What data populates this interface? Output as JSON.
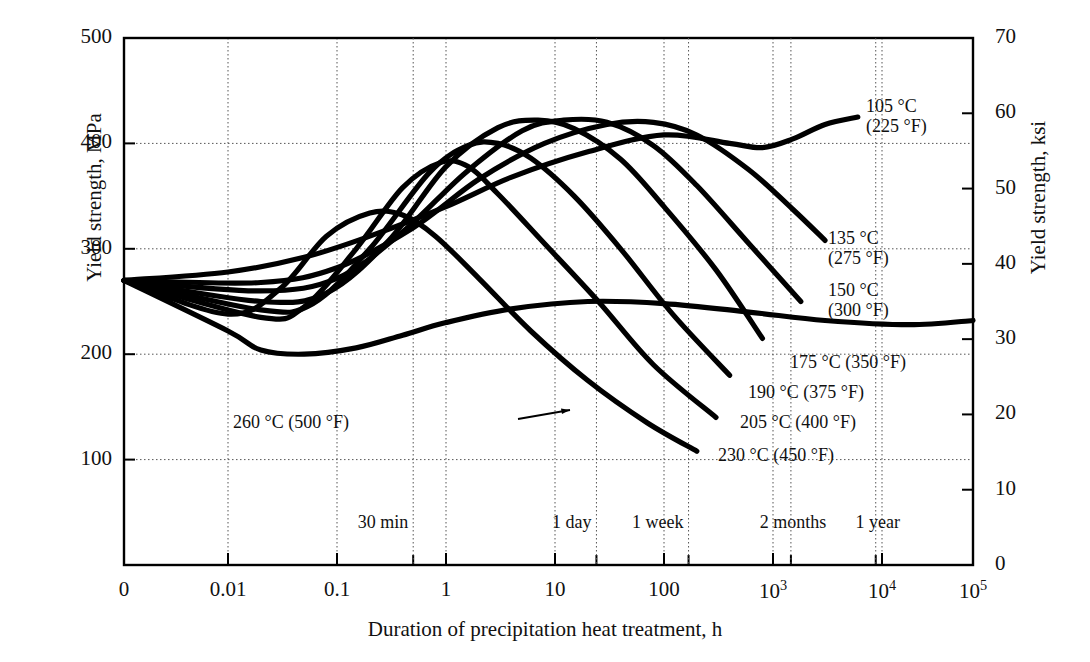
{
  "axes": {
    "y_left_label": "Yield strength, MPa",
    "y_right_label": "Yield strength, ksi",
    "x_label": "Duration of precipitation heat treatment, h",
    "y_left_ticks": [
      "500",
      "400",
      "300",
      "200",
      "100"
    ],
    "y_right_ticks": [
      "70",
      "60",
      "50",
      "40",
      "30",
      "20",
      "10",
      "0"
    ],
    "x_ticks": [
      "0",
      "0.01",
      "0.1",
      "1",
      "10",
      "100",
      "10³",
      "10⁴",
      "10⁵"
    ]
  },
  "time_markers": [
    {
      "label": "30 min",
      "x": 0.5
    },
    {
      "label": "1 day",
      "x": 24
    },
    {
      "label": "1 week",
      "x": 168
    },
    {
      "label": "2 months",
      "x": 1460
    },
    {
      "label": "1 year",
      "x": 8760
    }
  ],
  "annotations": [
    {
      "name": "label-105c",
      "line1": "105 °C",
      "line2": "(225 °F)"
    },
    {
      "name": "label-135c",
      "line1": "135 °C",
      "line2": "(275 °F)"
    },
    {
      "name": "label-150c",
      "line1": "150 °C",
      "line2": "(300 °F)"
    },
    {
      "name": "label-175c",
      "line1": "175 °C (350 °F)",
      "line2": ""
    },
    {
      "name": "label-190c",
      "line1": "190 °C (375 °F)",
      "line2": ""
    },
    {
      "name": "label-205c",
      "line1": "205 °C (400 °F)",
      "line2": ""
    },
    {
      "name": "label-230c",
      "line1": "230 °C (450 °F)",
      "line2": ""
    },
    {
      "name": "label-260c",
      "line1": "260 °C (500 °F)",
      "line2": ""
    }
  ],
  "chart_data": {
    "type": "line",
    "title": "",
    "xlabel": "Duration of precipitation heat treatment, h",
    "ylabel": "Yield strength, MPa",
    "ylabel_secondary": "Yield strength, ksi",
    "xscale": "log-with-zero-origin",
    "xlim": [
      0,
      100000
    ],
    "ylim": [
      0,
      500
    ],
    "ylim_secondary": [
      0,
      70
    ],
    "grid": true,
    "legend": "inline-annotations-right",
    "x_tick_values": [
      0,
      0.01,
      0.1,
      1,
      10,
      100,
      1000,
      10000,
      100000
    ],
    "y_tick_values": [
      100,
      200,
      300,
      400,
      500
    ],
    "y_tick_values_secondary": [
      0,
      10,
      20,
      30,
      40,
      50,
      60,
      70
    ],
    "initial_strength_MPa": 270,
    "series": [
      {
        "name": "105 °C (225 °F)",
        "points": [
          [
            0,
            270
          ],
          [
            0.01,
            278
          ],
          [
            0.05,
            292
          ],
          [
            0.2,
            312
          ],
          [
            1,
            340
          ],
          [
            4,
            368
          ],
          [
            20,
            392
          ],
          [
            100,
            408
          ],
          [
            400,
            400
          ],
          [
            800,
            396
          ],
          [
            1500,
            404
          ],
          [
            3000,
            418
          ],
          [
            6000,
            425
          ]
        ]
      },
      {
        "name": "135 °C (275 °F)",
        "points": [
          [
            0,
            270
          ],
          [
            0.02,
            268
          ],
          [
            0.1,
            282
          ],
          [
            0.5,
            320
          ],
          [
            2,
            366
          ],
          [
            8,
            400
          ],
          [
            30,
            418
          ],
          [
            80,
            420
          ],
          [
            200,
            408
          ],
          [
            600,
            375
          ],
          [
            1500,
            338
          ],
          [
            3000,
            308
          ]
        ]
      },
      {
        "name": "150 °C (300 °F)",
        "points": [
          [
            0,
            270
          ],
          [
            0.02,
            260
          ],
          [
            0.1,
            272
          ],
          [
            0.4,
            316
          ],
          [
            1.5,
            372
          ],
          [
            5,
            412
          ],
          [
            12,
            422
          ],
          [
            30,
            420
          ],
          [
            80,
            398
          ],
          [
            200,
            360
          ],
          [
            600,
            305
          ],
          [
            1800,
            250
          ]
        ]
      },
      {
        "name": "175 °C (350 °F)",
        "points": [
          [
            0,
            270
          ],
          [
            0.02,
            250
          ],
          [
            0.08,
            258
          ],
          [
            0.3,
            308
          ],
          [
            1,
            378
          ],
          [
            3,
            415
          ],
          [
            7,
            422
          ],
          [
            15,
            414
          ],
          [
            40,
            385
          ],
          [
            100,
            340
          ],
          [
            300,
            280
          ],
          [
            800,
            215
          ]
        ]
      },
      {
        "name": "190 °C (375 °F)",
        "points": [
          [
            0,
            270
          ],
          [
            0.02,
            242
          ],
          [
            0.06,
            248
          ],
          [
            0.2,
            300
          ],
          [
            0.7,
            372
          ],
          [
            1.6,
            398
          ],
          [
            3,
            400
          ],
          [
            6,
            386
          ],
          [
            15,
            350
          ],
          [
            40,
            300
          ],
          [
            120,
            238
          ],
          [
            400,
            180
          ]
        ]
      },
      {
        "name": "205 °C (400 °F)",
        "points": [
          [
            0,
            270
          ],
          [
            0.02,
            235
          ],
          [
            0.05,
            245
          ],
          [
            0.15,
            300
          ],
          [
            0.4,
            358
          ],
          [
            0.9,
            382
          ],
          [
            1.6,
            378
          ],
          [
            3,
            352
          ],
          [
            8,
            305
          ],
          [
            25,
            250
          ],
          [
            80,
            190
          ],
          [
            300,
            140
          ]
        ]
      },
      {
        "name": "230 °C (450 °F)",
        "points": [
          [
            0,
            270
          ],
          [
            0.01,
            238
          ],
          [
            0.03,
            262
          ],
          [
            0.08,
            312
          ],
          [
            0.2,
            334
          ],
          [
            0.4,
            332
          ],
          [
            0.8,
            312
          ],
          [
            2,
            272
          ],
          [
            6,
            222
          ],
          [
            20,
            175
          ],
          [
            70,
            135
          ],
          [
            200,
            108
          ]
        ]
      },
      {
        "name": "260 °C (500 °F)",
        "points": [
          [
            0,
            270
          ],
          [
            0.01,
            222
          ],
          [
            0.02,
            204
          ],
          [
            0.05,
            200
          ],
          [
            0.15,
            206
          ],
          [
            0.4,
            218
          ],
          [
            1,
            230
          ],
          [
            4,
            243
          ],
          [
            20,
            250
          ],
          [
            100,
            248
          ],
          [
            600,
            240
          ],
          [
            3000,
            232
          ],
          [
            20000,
            228
          ],
          [
            100000,
            232
          ]
        ]
      }
    ]
  }
}
